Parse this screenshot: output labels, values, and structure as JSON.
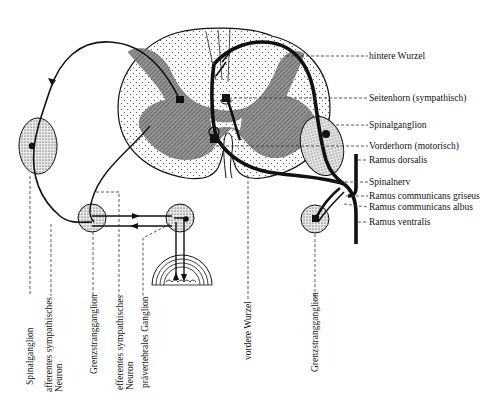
{
  "figure": {
    "right_labels": [
      {
        "id": "hintere-wurzel",
        "text": "hintere Wurzel",
        "y": 16
      },
      {
        "id": "seitenhorn",
        "text": "Seitenhorn (sympathisch)",
        "y": 98
      },
      {
        "id": "spinalganglion-right",
        "text": "Spinalganglion",
        "y": 125
      },
      {
        "id": "vorderhorn",
        "text": "Vorderhorn (motorisch)",
        "y": 146
      },
      {
        "id": "ramus-dorsalis",
        "text": "Ramus dorsalis",
        "y": 160
      },
      {
        "id": "spinalnerv",
        "text": "Spinalnerv",
        "y": 182
      },
      {
        "id": "ramus-comm-griseus",
        "text": "Ramus communicans griseus",
        "y": 196
      },
      {
        "id": "ramus-comm-albus",
        "text": "Ramus communicans albus",
        "y": 207
      },
      {
        "id": "ramus-ventralis",
        "text": "Ramus ventralis",
        "y": 222
      }
    ],
    "bottom_labels": [
      {
        "id": "spinalganglion-left",
        "lines": [
          "Spinalganglion"
        ],
        "x": 30
      },
      {
        "id": "afferentes-neuron",
        "lines": [
          "afferentes sympathisches",
          "Neuron"
        ],
        "x": 44
      },
      {
        "id": "grenzstrangganglion-left",
        "lines": [
          "Grenzstrangganglion"
        ],
        "x": 90
      },
      {
        "id": "efferentes-neuron",
        "lines": [
          "efferentes sympathisches",
          "Neuron"
        ],
        "x": 118
      },
      {
        "id": "praevertebrales-ganglion",
        "lines": [
          "prävertebrales Ganglion"
        ],
        "x": 142
      },
      {
        "id": "vordere-wurzel",
        "lines": [
          "vordere Wurzel"
        ],
        "x": 247
      },
      {
        "id": "grenzstrangganglion-right",
        "lines": [
          "Grenzstrangganglion"
        ],
        "x": 313
      }
    ]
  }
}
